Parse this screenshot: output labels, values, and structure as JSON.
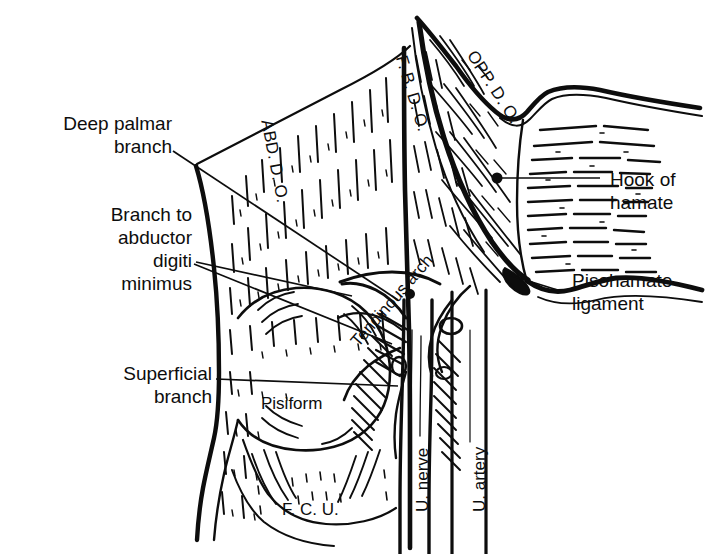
{
  "figure": {
    "ink_color": "#0d0d0d",
    "background_color": "#ffffff",
    "width": 706,
    "height": 554
  },
  "callout_labels": [
    {
      "id": "deep-palmar-branch",
      "text": "Deep palmar\nbranch",
      "side": "left",
      "x": 22,
      "y": 112
    },
    {
      "id": "branch-to-abductor-digiti-minimus",
      "text": "Branch to\nabductor\ndigiti\nminimus",
      "side": "left",
      "x": 80,
      "y": 203
    },
    {
      "id": "superficial-branch",
      "text": "Superficial\nbranch",
      "side": "left",
      "x": 88,
      "y": 362
    },
    {
      "id": "hook-of-hamate",
      "text": "Hook of\nhamate",
      "side": "right",
      "x": 610,
      "y": 168
    },
    {
      "id": "pisohamate-ligament",
      "text": "Pisohamate\nligament",
      "side": "right",
      "x": 572,
      "y": 269
    }
  ],
  "in_figure_labels": [
    {
      "id": "abd-d-o",
      "text": "ABD. D. O.",
      "x": 276,
      "y": 118,
      "rotation": 79,
      "size": "normal"
    },
    {
      "id": "f-b-d-o",
      "text": "F. B. D. O.",
      "x": 410,
      "y": 53,
      "rotation": 73,
      "size": "normal"
    },
    {
      "id": "opp-d-o",
      "text": "OPP. D. O.",
      "x": 479,
      "y": 47,
      "rotation": 57,
      "size": "normal"
    },
    {
      "id": "tendinous-arch",
      "text": "Tendinous arch",
      "x": 347,
      "y": 338,
      "rotation": -49,
      "size": "normal"
    },
    {
      "id": "pisiform",
      "text": "Pisiform",
      "x": 261,
      "y": 394,
      "rotation": 0,
      "size": "normal"
    },
    {
      "id": "f-c-u",
      "text": "F. C. U.",
      "x": 282,
      "y": 500,
      "rotation": 0,
      "size": "normal"
    },
    {
      "id": "u-nerve",
      "text": "U. nerve",
      "x": 413,
      "y": 512,
      "rotation": -90,
      "size": "normal"
    },
    {
      "id": "u-artery",
      "text": "U. artery",
      "x": 470,
      "y": 512,
      "rotation": -90,
      "size": "normal"
    }
  ],
  "anatomical_structures": [
    "abductor digiti minimi muscle",
    "flexor brevis digiti minimi muscle",
    "opponens digiti minimi muscle",
    "hook of hamate",
    "pisiform bone",
    "pisohamate ligament",
    "tendinous arch",
    "flexor carpi ulnaris tendon",
    "ulnar nerve",
    "ulnar artery",
    "deep palmar branch of ulnar nerve",
    "superficial branch of ulnar nerve",
    "branch to abductor digiti minimus"
  ]
}
